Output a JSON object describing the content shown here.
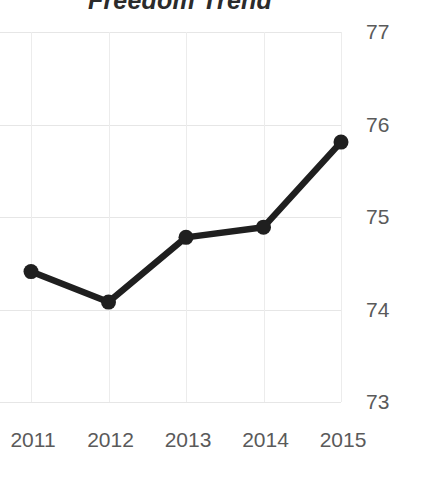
{
  "chart_data": {
    "type": "line",
    "title": "Freedom Trend",
    "xlabel": "",
    "ylabel": "",
    "categories": [
      "2011",
      "2012",
      "2013",
      "2014",
      "2015"
    ],
    "x": [
      2011,
      2012,
      2013,
      2014,
      2015
    ],
    "values": [
      74.41,
      74.08,
      74.78,
      74.89,
      75.81
    ],
    "series": [
      {
        "name": "Freedom Trend",
        "values": [
          74.41,
          74.08,
          74.78,
          74.89,
          75.81
        ]
      }
    ],
    "yticks": [
      77,
      76,
      75,
      74,
      73
    ],
    "ytick_labels": [
      "77",
      "76",
      "75",
      "74",
      "73"
    ],
    "ylim": [
      73,
      77
    ],
    "xlim": [
      2011,
      2015
    ],
    "grid": true,
    "legend": false,
    "legend_position": "none",
    "marker": "circle",
    "line_color": "#1f1f1f",
    "marker_color": "#1f1f1f",
    "grid_color": "#e6e6e6",
    "tick_label_color": "#5a5a5a",
    "title_color": "#2b2b2b",
    "y_axis_side": "right"
  },
  "axes": {
    "y_ticks": [
      {
        "label": "77",
        "value": 77
      },
      {
        "label": "76",
        "value": 76
      },
      {
        "label": "75",
        "value": 75
      },
      {
        "label": "74",
        "value": 74
      },
      {
        "label": "73",
        "value": 73
      }
    ],
    "x_ticks": [
      {
        "label": "2011",
        "value": 2011
      },
      {
        "label": "2012",
        "value": 2012
      },
      {
        "label": "2013",
        "value": 2013
      },
      {
        "label": "2014",
        "value": 2014
      },
      {
        "label": "2015",
        "value": 2015
      }
    ]
  }
}
